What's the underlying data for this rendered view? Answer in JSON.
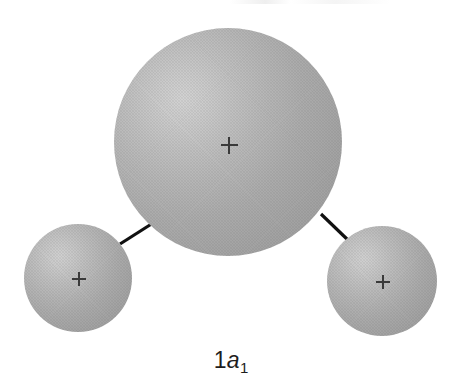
{
  "figure": {
    "kind": "molecular-orbital-diagram",
    "background_color": "#ffffff",
    "width": 462,
    "height": 383,
    "label": {
      "full_text": "1a1",
      "prefix": "1",
      "symbol": "a",
      "subscript": "1"
    },
    "lobes": [
      {
        "name": "central-lobe",
        "role": "large central atom lobe",
        "center_x": 228,
        "center_y": 142,
        "radius": 114,
        "sign": "+",
        "highlight_color": "#d2d2d2",
        "shadow_color": "#9a9a9a"
      },
      {
        "name": "left-lobe",
        "role": "left hydrogen lobe",
        "center_x": 78,
        "center_y": 278,
        "radius": 54,
        "sign": "+",
        "highlight_color": "#d0d0d0",
        "shadow_color": "#989898"
      },
      {
        "name": "right-lobe",
        "role": "right hydrogen lobe",
        "center_x": 382,
        "center_y": 281,
        "radius": 55,
        "sign": "+",
        "highlight_color": "#d0d0d0",
        "shadow_color": "#989898"
      }
    ],
    "bonds": [
      {
        "name": "bond-left",
        "x1": 120,
        "y1": 244,
        "x2": 153,
        "y2": 223,
        "color": "#111111",
        "width": 3.2
      },
      {
        "name": "bond-right",
        "x1": 321,
        "y1": 214,
        "x2": 349,
        "y2": 241,
        "color": "#111111",
        "width": 3.2
      }
    ],
    "nucleus_markers": [
      {
        "name": "nucleus-center",
        "x": 229,
        "y": 145,
        "sign": "+"
      },
      {
        "name": "nucleus-left",
        "x": 79,
        "y": 279,
        "sign": "+"
      },
      {
        "name": "nucleus-right",
        "x": 383,
        "y": 282,
        "sign": "+"
      }
    ]
  },
  "chart_data": {
    "type": "scatter",
    "title": "1a1",
    "xlabel": "",
    "ylabel": "",
    "x": [
      228,
      78,
      382
    ],
    "y": [
      142,
      278,
      281
    ],
    "sizes": [
      114,
      54,
      55
    ],
    "labels": [
      "central-lobe",
      "left-lobe",
      "right-lobe"
    ],
    "annotations": [
      "+",
      "+",
      "+"
    ],
    "legend": [],
    "grid": false
  }
}
